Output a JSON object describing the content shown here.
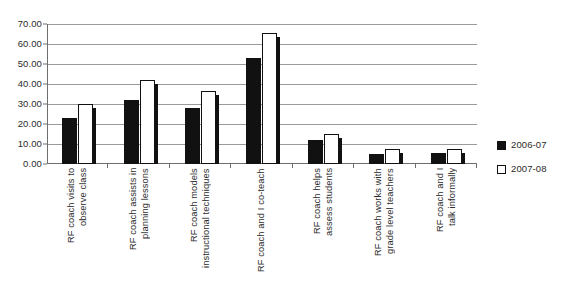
{
  "chart_data": {
    "type": "bar",
    "title": "",
    "xlabel": "",
    "ylabel": "",
    "ylim": [
      0,
      70
    ],
    "ytick_step": 10,
    "grid": true,
    "legend_position": "right",
    "yticks": [
      "0.00",
      "10.00",
      "20.00",
      "30.00",
      "40.00",
      "50.00",
      "60.00",
      "70.00"
    ],
    "categories": [
      "RF coach visits to observe class",
      "RF coach assists in planning lessons",
      "RF coach models instructional techniques",
      "RF coach and I co-teach",
      "RF coach helps assess students",
      "RF coach works with grade level teachers",
      "RF coach and I talk informally"
    ],
    "category_lines": [
      [
        "RF coach visits to",
        "observe class"
      ],
      [
        "RF coach assists in",
        "planning lessons"
      ],
      [
        "RF coach models",
        "instructional techniques"
      ],
      [
        "RF coach and I co-teach",
        ""
      ],
      [
        "RF coach helps",
        "assess students"
      ],
      [
        "RF coach works with",
        "grade level teachers"
      ],
      [
        "RF coach and I",
        "talk informally"
      ]
    ],
    "series": [
      {
        "name": "2006-07",
        "color": "#111111",
        "fill": "solid",
        "values": [
          23.0,
          32.0,
          28.0,
          53.0,
          12.0,
          5.0,
          5.5
        ]
      },
      {
        "name": "2007-08",
        "color": "#ffffff",
        "fill": "outline",
        "values": [
          30.0,
          42.0,
          36.5,
          65.5,
          15.0,
          7.5,
          7.5
        ]
      }
    ]
  },
  "legend": {
    "items": [
      {
        "label": "2006-07"
      },
      {
        "label": "2007-08"
      }
    ]
  }
}
